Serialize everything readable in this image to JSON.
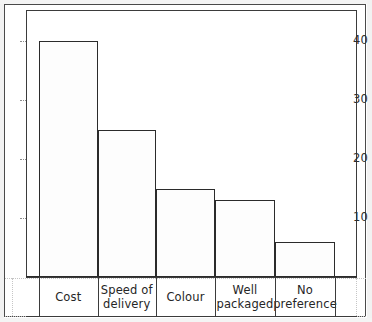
{
  "chart_data": {
    "type": "bar",
    "title": "",
    "subtitle": "",
    "xlabel": "",
    "ylabel": "",
    "categories": [
      "Cost",
      "Speed of delivery",
      "Colour",
      "Well packaged",
      "No preference"
    ],
    "values": [
      40,
      25,
      15,
      13,
      6
    ],
    "ylim": [
      0,
      45
    ],
    "ytick_labels": [
      "40",
      "30",
      "20",
      "10"
    ],
    "ytick_values": [
      40,
      30,
      20,
      10
    ],
    "minor_gridline_values": [
      45,
      35,
      25,
      15,
      5
    ],
    "grid": true,
    "grid_style": "dotted",
    "legend": "none",
    "legend_position": "none",
    "annotations": [],
    "bar_fill_color": "#fdfdfd",
    "bar_edge_color": "#2b2b2b",
    "grid_color": "#b9b9b9",
    "axis_color": "#3b3b3b",
    "frame_color": "#4a4a4a",
    "text_color": "#262626"
  },
  "axis": {
    "y_ticks": [
      {
        "label": "40",
        "value": 40
      },
      {
        "label": "30",
        "value": 30
      },
      {
        "label": "20",
        "value": 20
      },
      {
        "label": "10",
        "value": 10
      }
    ],
    "categories": [
      {
        "label_line1": "Cost",
        "label_line2": ""
      },
      {
        "label_line1": "Speed of",
        "label_line2": "delivery"
      },
      {
        "label_line1": "Colour",
        "label_line2": ""
      },
      {
        "label_line1": "Well",
        "label_line2": "packaged"
      },
      {
        "label_line1": "No",
        "label_line2": "preference"
      }
    ]
  }
}
